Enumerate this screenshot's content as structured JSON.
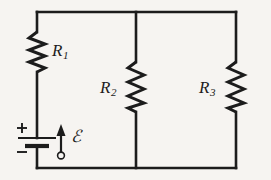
{
  "figure": {
    "kind": "electrical-circuit-schematic",
    "background_color": "#f6f4f1",
    "line_color": "#1c1c1c"
  },
  "components": {
    "resistor_1": {
      "label": "R",
      "subscript": "1",
      "name": "R1",
      "symbol": "zigzag-resistor",
      "orientation": "vertical",
      "branch": "left-rail-series"
    },
    "resistor_2": {
      "label": "R",
      "subscript": "2",
      "name": "R2",
      "symbol": "zigzag-resistor",
      "orientation": "vertical",
      "branch": "middle-parallel"
    },
    "resistor_3": {
      "label": "R",
      "subscript": "3",
      "name": "R3",
      "symbol": "zigzag-resistor",
      "orientation": "vertical",
      "branch": "right-parallel"
    },
    "battery": {
      "name": "emf-source",
      "symbol": "battery-cell",
      "positive_terminal": "+",
      "negative_terminal": "−",
      "positive_position": "top",
      "negative_position": "bottom"
    },
    "emf": {
      "label": "ℰ",
      "name": "emf-script-epsilon",
      "arrow_direction": "up",
      "arrow_symbol": "arrow-with-circle-base"
    }
  },
  "wires": {
    "top_rail": "horizontal top conductor",
    "bottom_rail": "horizontal bottom conductor",
    "left_rail": "vertical left conductor",
    "right_rail": "vertical right conductor",
    "middle_branch": "vertical middle conductor"
  }
}
